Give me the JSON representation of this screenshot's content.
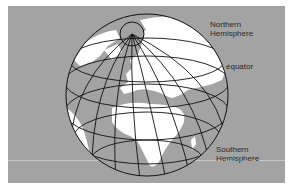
{
  "diagram": {
    "type": "globe-hemispheres",
    "background_color": "#a3a3a3",
    "land_color": "#ffffff",
    "grid_color": "#111111",
    "labels": {
      "northern": [
        "Northern",
        "Hemisphere"
      ],
      "equator": "equator",
      "southern": [
        "Southern",
        "Hemisphere"
      ]
    }
  }
}
